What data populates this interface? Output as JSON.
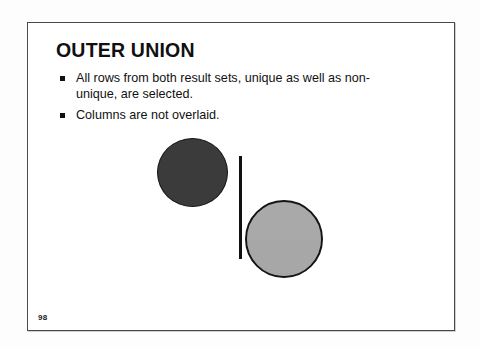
{
  "slide": {
    "title": "OUTER UNION",
    "page_number": "98",
    "bullets": [
      {
        "text": "All rows from both result sets, unique as well as non-unique, are selected."
      },
      {
        "text": "Columns are not overlaid."
      }
    ],
    "diagram": {
      "description": "Two separate circles, one dark and one light, divided by a vertical bar",
      "left_circle": {
        "fill_color": "#3b3b3b",
        "stroke_color": "#151515"
      },
      "right_circle": {
        "fill_color": "#a9a9a9",
        "stroke_color": "#141414"
      },
      "divider": {
        "color": "#101010"
      }
    }
  },
  "colors": {
    "page_background": "#fdfdfd",
    "slide_background": "#ffffff",
    "frame_border": "#4a4a4a",
    "text": "#111111"
  }
}
